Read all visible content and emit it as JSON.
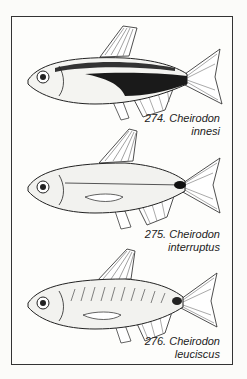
{
  "plate": {
    "figures": [
      {
        "number": "274.",
        "genus": "Cheirodon",
        "species": "innesi",
        "label_line1": "274. Cheirodon",
        "label_line2": "innesi"
      },
      {
        "number": "275.",
        "genus": "Cheirodon",
        "species": "interruptus",
        "label_line1": "275. Cheirodon",
        "label_line2": "interruptus"
      },
      {
        "number": "276.",
        "genus": "Cheirodon",
        "species": "leuciscus",
        "label_line1": "276. Cheirodon",
        "label_line2": "leuciscus"
      }
    ]
  }
}
